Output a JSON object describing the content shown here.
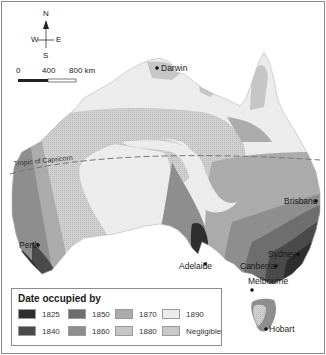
{
  "map": {
    "compass": {
      "n": "N",
      "s": "S",
      "e": "E",
      "w": "W"
    },
    "scale_bar": {
      "ticks": [
        "0",
        "400",
        "800 km"
      ]
    },
    "tropic_label": "Tropic of Capricorn",
    "cities": [
      {
        "name": "Darwin"
      },
      {
        "name": "Brisbane"
      },
      {
        "name": "Perth"
      },
      {
        "name": "Adelaide"
      },
      {
        "name": "Sydney"
      },
      {
        "name": "Canberra"
      },
      {
        "name": "Melbourne"
      },
      {
        "name": "Hobart"
      }
    ],
    "colors": {
      "1825": "#2e2e2e",
      "1840": "#4a4a4a",
      "1850": "#6e6e6e",
      "1860": "#8e8e8e",
      "1870": "#ababab",
      "1880": "#c6c6c6",
      "1890": "#ececec",
      "negligible": "#c9c9c9"
    }
  },
  "legend": {
    "title": "Date occupied by",
    "items": [
      {
        "label": "1825",
        "color": "#2e2e2e"
      },
      {
        "label": "1840",
        "color": "#4a4a4a"
      },
      {
        "label": "1850",
        "color": "#6e6e6e"
      },
      {
        "label": "1860",
        "color": "#8e8e8e"
      },
      {
        "label": "1870",
        "color": "#ababab"
      },
      {
        "label": "1880",
        "color": "#c6c6c6"
      },
      {
        "label": "1890",
        "color": "#ececec"
      },
      {
        "label": "Negligible",
        "color": "#c9c9c9"
      }
    ]
  }
}
